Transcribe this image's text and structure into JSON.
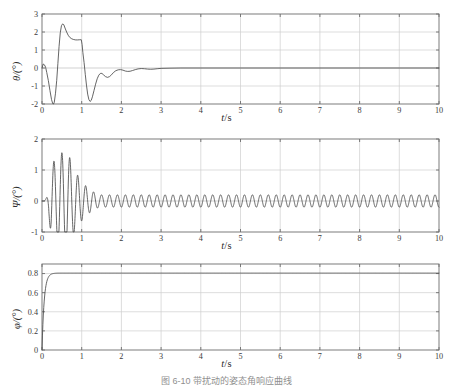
{
  "figure": {
    "caption": "图 6-10 带扰动的姿态角响应曲线",
    "background_color": "#ffffff",
    "curve_color": "#4a4a4a",
    "grid_color": "#cfcfcf",
    "axis_color": "#6d6d6d"
  },
  "chart_data": [
    {
      "type": "line",
      "name": "theta-response",
      "title": "",
      "xlabel": "t/s",
      "ylabel": "θ/(°)",
      "xlim": [
        0,
        10
      ],
      "ylim": [
        -2,
        3
      ],
      "xticks": [
        0,
        1,
        2,
        3,
        4,
        5,
        6,
        7,
        8,
        9,
        10
      ],
      "xtick_labels": [
        "0",
        "1",
        "2",
        "3",
        "4",
        "5",
        "6",
        "7",
        "8",
        "9",
        "10"
      ],
      "yticks": [
        -2,
        -1,
        0,
        1,
        2,
        3
      ],
      "ytick_labels": [
        "-2",
        "-1",
        "0",
        "1",
        "2",
        "3"
      ],
      "grid": true,
      "legend": "none",
      "series": [
        {
          "name": "θ",
          "points": [
            [
              0.0,
              0.0
            ],
            [
              0.03,
              0.22
            ],
            [
              0.06,
              0.18
            ],
            [
              0.09,
              0.05
            ],
            [
              0.12,
              -0.25
            ],
            [
              0.16,
              -0.7
            ],
            [
              0.2,
              -1.25
            ],
            [
              0.24,
              -1.75
            ],
            [
              0.27,
              -1.98
            ],
            [
              0.29,
              -2.05
            ],
            [
              0.31,
              -1.9
            ],
            [
              0.34,
              -1.4
            ],
            [
              0.37,
              -0.7
            ],
            [
              0.4,
              0.25
            ],
            [
              0.43,
              1.2
            ],
            [
              0.46,
              1.95
            ],
            [
              0.49,
              2.35
            ],
            [
              0.52,
              2.45
            ],
            [
              0.55,
              2.4
            ],
            [
              0.58,
              2.22
            ],
            [
              0.62,
              2.0
            ],
            [
              0.66,
              1.82
            ],
            [
              0.7,
              1.7
            ],
            [
              0.75,
              1.62
            ],
            [
              0.8,
              1.58
            ],
            [
              0.85,
              1.56
            ],
            [
              0.9,
              1.56
            ],
            [
              0.95,
              1.57
            ],
            [
              0.99,
              1.57
            ],
            [
              1.01,
              1.3
            ],
            [
              1.03,
              0.85
            ],
            [
              1.06,
              0.3
            ],
            [
              1.09,
              -0.35
            ],
            [
              1.12,
              -0.95
            ],
            [
              1.15,
              -1.45
            ],
            [
              1.18,
              -1.75
            ],
            [
              1.21,
              -1.86
            ],
            [
              1.24,
              -1.8
            ],
            [
              1.27,
              -1.6
            ],
            [
              1.31,
              -1.25
            ],
            [
              1.35,
              -0.9
            ],
            [
              1.39,
              -0.6
            ],
            [
              1.43,
              -0.4
            ],
            [
              1.47,
              -0.3
            ],
            [
              1.51,
              -0.3
            ],
            [
              1.55,
              -0.38
            ],
            [
              1.6,
              -0.48
            ],
            [
              1.65,
              -0.52
            ],
            [
              1.7,
              -0.48
            ],
            [
              1.75,
              -0.38
            ],
            [
              1.8,
              -0.25
            ],
            [
              1.86,
              -0.15
            ],
            [
              1.92,
              -0.1
            ],
            [
              1.98,
              -0.09
            ],
            [
              2.04,
              -0.12
            ],
            [
              2.1,
              -0.17
            ],
            [
              2.16,
              -0.19
            ],
            [
              2.22,
              -0.18
            ],
            [
              2.28,
              -0.14
            ],
            [
              2.35,
              -0.09
            ],
            [
              2.42,
              -0.05
            ],
            [
              2.5,
              -0.03
            ],
            [
              2.58,
              -0.04
            ],
            [
              2.66,
              -0.06
            ],
            [
              2.74,
              -0.07
            ],
            [
              2.82,
              -0.06
            ],
            [
              2.9,
              -0.04
            ],
            [
              3.0,
              -0.02
            ],
            [
              3.2,
              -0.01
            ],
            [
              3.5,
              0.0
            ],
            [
              4.0,
              0.0
            ],
            [
              5.0,
              0.0
            ],
            [
              6.0,
              0.0
            ],
            [
              7.0,
              0.0
            ],
            [
              8.0,
              0.0
            ],
            [
              9.0,
              0.0
            ],
            [
              10.0,
              0.0
            ]
          ]
        }
      ]
    },
    {
      "type": "line",
      "name": "psi-response",
      "title": "",
      "xlabel": "t/s",
      "ylabel": "Ψ/(°)",
      "xlim": [
        0,
        10
      ],
      "ylim": [
        -1,
        2
      ],
      "xticks": [
        0,
        1,
        2,
        3,
        4,
        5,
        6,
        7,
        8,
        9,
        10
      ],
      "xtick_labels": [
        "0",
        "1",
        "2",
        "3",
        "4",
        "5",
        "6",
        "7",
        "8",
        "9",
        "10"
      ],
      "yticks": [
        -1,
        0,
        1,
        2
      ],
      "ytick_labels": [
        "-1",
        "0",
        "1",
        "2"
      ],
      "grid": true,
      "legend": "none",
      "generator": {
        "description": "damped high-frequency oscillation settling to steady limit cycle",
        "t_start": 0.0,
        "t_end": 10.0,
        "samples": 2600,
        "burst": {
          "onset": 0.05,
          "peak_time": 0.62,
          "envelope_peak": 1.72,
          "decay_rate": 2.6,
          "frequency_hz": 5.0
        },
        "steady": {
          "amplitude": 0.2,
          "frequency_hz": 5.0,
          "offset": 0.0
        }
      }
    },
    {
      "type": "line",
      "name": "phi-response",
      "title": "",
      "xlabel": "t/s",
      "ylabel": "φ/(°)",
      "xlim": [
        0,
        10
      ],
      "ylim": [
        0,
        0.9
      ],
      "xticks": [
        0,
        1,
        2,
        3,
        4,
        5,
        6,
        7,
        8,
        9,
        10
      ],
      "xtick_labels": [
        "0",
        "1",
        "2",
        "3",
        "4",
        "5",
        "6",
        "7",
        "8",
        "9",
        "10"
      ],
      "yticks": [
        0,
        0.2,
        0.4,
        0.6,
        0.8
      ],
      "ytick_labels": [
        "0",
        "0.2",
        "0.4",
        "0.6",
        "0.8"
      ],
      "grid": true,
      "legend": "none",
      "generator": {
        "description": "first-order step response to steady value",
        "t_start": 0.0,
        "t_end": 10.0,
        "samples": 900,
        "step": {
          "final_value": 0.805,
          "time_constant": 0.055,
          "settle_time": 0.3
        }
      }
    }
  ]
}
